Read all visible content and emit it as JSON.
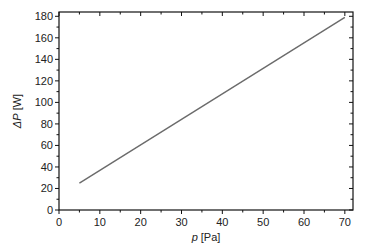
{
  "chart_data": {
    "type": "line",
    "title": "",
    "xlabel": "p [Pa]",
    "xlabel_italic": "p",
    "xlabel_unit": " [Pa]",
    "ylabel": "ΔP [W]",
    "ylabel_italic": "ΔP",
    "ylabel_unit": " [W]",
    "xlim": [
      0,
      72
    ],
    "ylim": [
      0,
      184
    ],
    "xticks": [
      0,
      10,
      20,
      30,
      40,
      50,
      60,
      70
    ],
    "yticks": [
      0,
      20,
      40,
      60,
      80,
      100,
      120,
      140,
      160,
      180
    ],
    "grid": false,
    "legend": null,
    "series": [
      {
        "name": "ΔP vs p",
        "color": "#6b6b6b",
        "x": [
          5,
          70
        ],
        "y": [
          25,
          179
        ]
      }
    ]
  }
}
